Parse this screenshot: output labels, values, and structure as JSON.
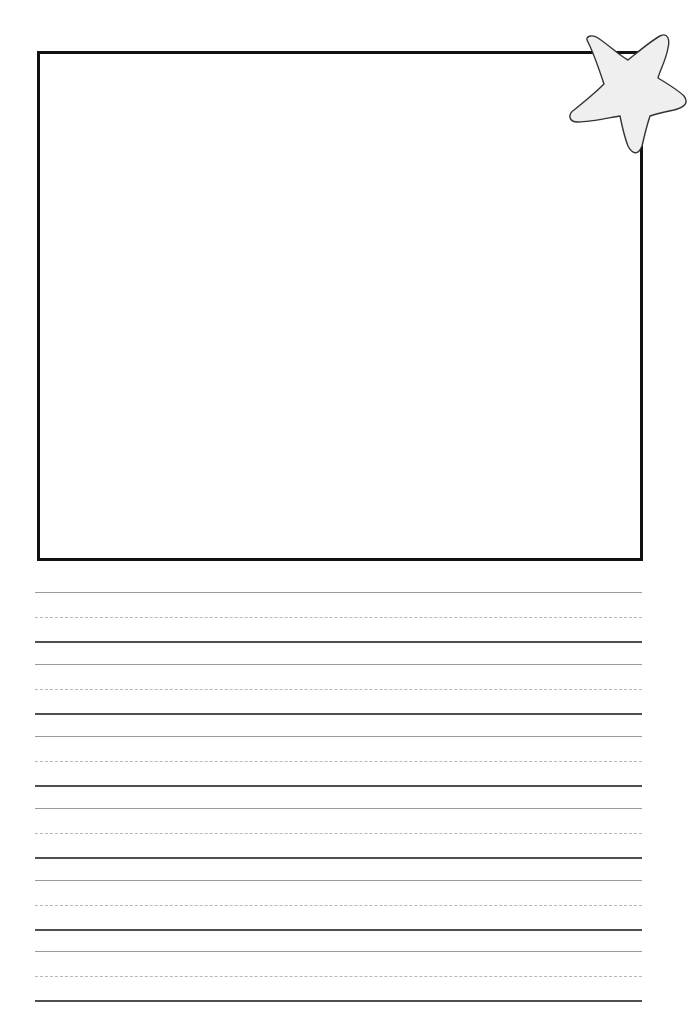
{
  "worksheet": {
    "type": "primary handwriting paper with drawing box",
    "drawing_box": {
      "label": "",
      "border_color": "#111111"
    },
    "decoration": {
      "icon": "star-icon",
      "fill": "#efefef",
      "stroke": "#333333"
    },
    "writing_lines": {
      "count": 6,
      "top_line_color": "#9a9a9a",
      "mid_line_color": "#b8b8b8",
      "baseline_color": "#4f4f4f",
      "sets": [
        {
          "index": 1,
          "top_y": 592
        },
        {
          "index": 2,
          "top_y": 665
        },
        {
          "index": 3,
          "top_y": 736
        },
        {
          "index": 4,
          "top_y": 808
        },
        {
          "index": 5,
          "top_y": 880
        },
        {
          "index": 6,
          "top_y": 951
        }
      ]
    }
  }
}
